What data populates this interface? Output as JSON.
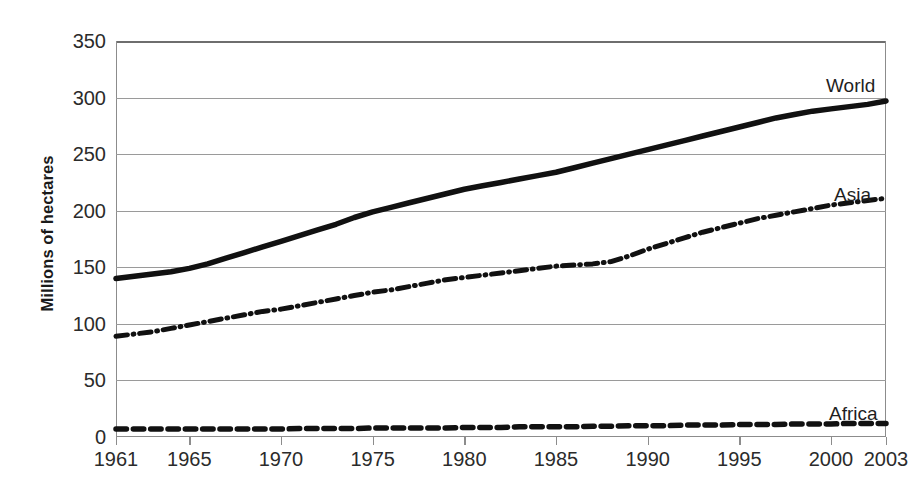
{
  "chart_data": {
    "type": "line",
    "title": "",
    "subtitle": "",
    "xlabel": "",
    "ylabel": "Millions of hectares",
    "xlim": [
      1961,
      2003
    ],
    "ylim": [
      0,
      350
    ],
    "grid": true,
    "legend_position": "inline-right-of-series",
    "x_ticks": [
      "1961",
      "1965",
      "1970",
      "1975",
      "1980",
      "1985",
      "1990",
      "1995",
      "2000",
      "2003"
    ],
    "x_tick_values": [
      1961,
      1965,
      1970,
      1975,
      1980,
      1985,
      1990,
      1995,
      2000,
      2003
    ],
    "y_ticks": [
      "0",
      "50",
      "100",
      "150",
      "200",
      "250",
      "300",
      "350"
    ],
    "y_tick_values": [
      0,
      50,
      100,
      150,
      200,
      250,
      300,
      350
    ],
    "x": [
      1961,
      1962,
      1963,
      1964,
      1965,
      1966,
      1967,
      1968,
      1969,
      1970,
      1971,
      1972,
      1973,
      1974,
      1975,
      1976,
      1977,
      1978,
      1979,
      1980,
      1981,
      1982,
      1983,
      1984,
      1985,
      1986,
      1987,
      1988,
      1989,
      1990,
      1991,
      1992,
      1993,
      1994,
      1995,
      1996,
      1997,
      1998,
      1999,
      2000,
      2001,
      2002,
      2003
    ],
    "series": [
      {
        "name": "World",
        "line_style": "solid",
        "color": "#111111",
        "width": 5.5,
        "values": [
          140,
          142,
          144,
          146,
          149,
          153,
          158,
          163,
          168,
          173,
          178,
          183,
          188,
          194,
          199,
          203,
          207,
          211,
          215,
          219,
          222,
          225,
          228,
          231,
          234,
          238,
          242,
          246,
          250,
          254,
          258,
          262,
          266,
          270,
          274,
          278,
          282,
          285,
          288,
          290,
          292,
          294,
          297
        ]
      },
      {
        "name": "Asia",
        "line_style": "dashdot",
        "color": "#111111",
        "width": 5.0,
        "values": [
          89,
          91,
          93,
          96,
          99,
          102,
          105,
          108,
          111,
          113,
          116,
          119,
          122,
          125,
          128,
          130,
          133,
          136,
          139,
          141,
          143,
          145,
          147,
          149,
          151,
          152,
          153,
          155,
          160,
          166,
          171,
          176,
          181,
          185,
          189,
          193,
          196,
          199,
          202,
          205,
          207,
          209,
          211
        ]
      },
      {
        "name": "Africa",
        "line_style": "dashed",
        "color": "#111111",
        "width": 5.5,
        "values": [
          7,
          7,
          7,
          7,
          7,
          7,
          7,
          7,
          7,
          7,
          7.5,
          7.5,
          7.5,
          7.5,
          8,
          8,
          8,
          8,
          8,
          8.5,
          8.5,
          8.5,
          9,
          9,
          9,
          9,
          9.5,
          9.5,
          10,
          10,
          10,
          10.5,
          10.5,
          10.5,
          11,
          11,
          11,
          11.5,
          11.5,
          11.5,
          12,
          12,
          12
        ]
      }
    ],
    "annotations": [
      {
        "text": "World",
        "x_px": 826,
        "y_px": 76
      },
      {
        "text": "Asia",
        "x_px": 834,
        "y_px": 185
      },
      {
        "text": "Africa",
        "x_px": 829,
        "y_px": 404
      }
    ]
  }
}
